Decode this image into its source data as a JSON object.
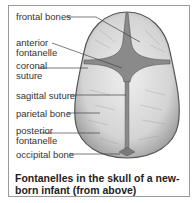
{
  "labels": {
    "frontal_bones": "frontal bones",
    "anterior_fontanelle_1": "anterior",
    "anterior_fontanelle_2": "fontanelle",
    "coronal_suture_1": "coronal",
    "coronal_suture_2": "suture",
    "sagittal_suture": "sagittal suture",
    "parietal_bone": "parietal bone",
    "posterior_fontanelle_1": "posterior",
    "posterior_fontanelle_2": "fontanelle",
    "occipital_bone": "occipital bone"
  },
  "caption": "Fontanelles in the skull of a new-born infant (from above)",
  "colors": {
    "bone_fill": "#d8d8d8",
    "fontanelle_fill": "#8a8a8a",
    "outline": "#555555",
    "leader": "#444444"
  }
}
